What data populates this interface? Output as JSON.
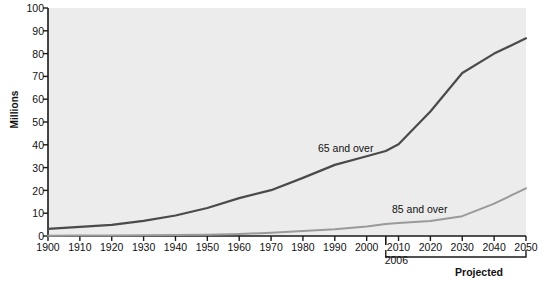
{
  "chart_data": {
    "type": "line",
    "title": "",
    "xlabel": "",
    "ylabel": "Millions",
    "xlim": [
      1900,
      2050
    ],
    "ylim": [
      0,
      100
    ],
    "grid": false,
    "legend_position": "inline-annotations",
    "x": [
      1900,
      1910,
      1920,
      1930,
      1940,
      1950,
      1960,
      1970,
      1980,
      1990,
      2000,
      2006,
      2010,
      2020,
      2030,
      2040,
      2050
    ],
    "xticklabels": [
      "1900",
      "1910",
      "1920",
      "1930",
      "1940",
      "1950",
      "1960",
      "1970",
      "1980",
      "1990",
      "2000",
      "2010",
      "2020",
      "2030",
      "2040",
      "2050"
    ],
    "yticklabels": [
      "0",
      "10",
      "20",
      "30",
      "40",
      "50",
      "60",
      "70",
      "80",
      "90",
      "100"
    ],
    "series": [
      {
        "name": "65 and over",
        "color": "#4a4a4a",
        "values": [
          3.1,
          4.0,
          4.9,
          6.6,
          9.0,
          12.3,
          16.6,
          20.1,
          25.5,
          31.2,
          35.0,
          37.3,
          40.2,
          54.6,
          71.5,
          80.0,
          86.7
        ]
      },
      {
        "name": "85 and over",
        "color": "#9a9a9a",
        "values": [
          0.1,
          0.2,
          0.2,
          0.3,
          0.4,
          0.6,
          0.9,
          1.4,
          2.2,
          3.0,
          4.2,
          5.3,
          5.7,
          6.6,
          8.7,
          14.2,
          20.9
        ]
      }
    ],
    "annotations": {
      "marker_2006_label": "2006",
      "projected_label": "Projected",
      "projected_range": [
        2006,
        2050
      ]
    }
  },
  "chart": {
    "series_labels": {
      "over65": "65 and over",
      "over85": "85 and over"
    }
  }
}
